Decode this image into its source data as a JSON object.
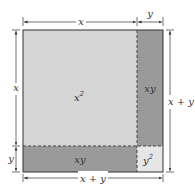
{
  "diagram": {
    "regions": [
      {
        "id": "x-squared",
        "label": "x",
        "exp": "2",
        "color": "#d6d6d6"
      },
      {
        "id": "xy-right",
        "label": "xy",
        "color": "#9a9a9a"
      },
      {
        "id": "xy-bottom",
        "label": "xy",
        "color": "#9a9a9a"
      },
      {
        "id": "y-squared",
        "label": "y",
        "exp": "2",
        "color": "#e6e6e6"
      }
    ],
    "dimensions": {
      "top_x": "x",
      "top_y": "y",
      "left_x": "x",
      "left_y": "y",
      "right_total": "x + y",
      "bottom_total": "x + y"
    },
    "colors": {
      "outline": "#333333",
      "dash": "#444444"
    }
  }
}
